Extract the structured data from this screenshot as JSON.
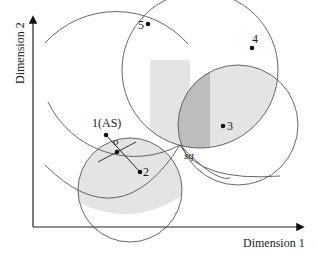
{
  "diagram": {
    "axes": {
      "x_label": "Dimension 1",
      "y_label": "Dimension 2"
    },
    "points": [
      {
        "id": "1",
        "label": "1(AS)",
        "x": 106,
        "y": 135
      },
      {
        "id": "2",
        "label": "2",
        "x": 140,
        "y": 172
      },
      {
        "id": "3",
        "label": "3",
        "x": 223,
        "y": 126
      },
      {
        "id": "4",
        "label": "4",
        "x": 252,
        "y": 48
      },
      {
        "id": "5",
        "label": "5",
        "x": 148,
        "y": 24
      },
      {
        "id": "o",
        "label": "o",
        "x": 117,
        "y": 152
      }
    ],
    "special_point": {
      "label": "sq",
      "x": 180,
      "y": 145
    },
    "colors": {
      "line": "#555555",
      "axis": "#222222",
      "shade_light": "#e6e6e6",
      "shade_dark": "#bdbdbd"
    }
  }
}
